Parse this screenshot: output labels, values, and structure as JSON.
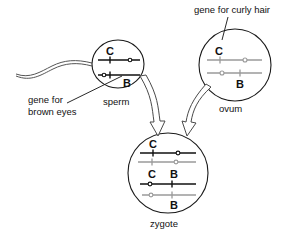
{
  "diagram": {
    "background_color": "#ffffff",
    "line_color": "#111111",
    "maternal_color": "#9a9a9a"
  },
  "annotations": {
    "curly_hair": "gene for curly hair",
    "brown_eyes_line1": "gene for",
    "brown_eyes_line2": "brown eyes"
  },
  "cells": {
    "sperm": {
      "name": "sperm",
      "alleles": {
        "curly": "C",
        "brown": "B"
      }
    },
    "ovum": {
      "name": "ovum",
      "alleles": {
        "curly": "C",
        "brown": "B"
      }
    },
    "zygote": {
      "name": "zygote",
      "alleles": {
        "curly_paternal": "C",
        "curly_maternal": "C",
        "brown_paternal": "B",
        "brown_maternal": "B"
      }
    }
  }
}
